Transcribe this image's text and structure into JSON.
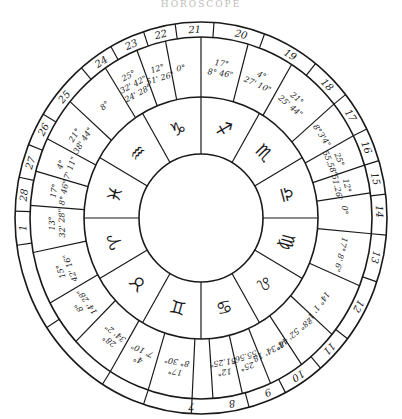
{
  "title": "HOROSCOPE",
  "colors": {
    "ink": "#1a1a1a",
    "paper": "#ffffff"
  },
  "geometry": {
    "cx": 201,
    "cy": 218,
    "outer_rx": 186,
    "outer_ry": 196,
    "house_ring_rx": 171,
    "house_ring_ry": 181,
    "degree_ring_rx": 117,
    "degree_ring_ry": 121,
    "inner_rx": 62,
    "inner_ry": 64
  },
  "zodiac_signs": [
    {
      "name": "capricorn",
      "glyph": "♑",
      "angle": -105
    },
    {
      "name": "sagittarius",
      "glyph": "♐",
      "angle": -75
    },
    {
      "name": "scorpio",
      "glyph": "♏",
      "angle": -45
    },
    {
      "name": "libra",
      "glyph": "♎",
      "angle": -15
    },
    {
      "name": "virgo",
      "glyph": "♍",
      "angle": 15
    },
    {
      "name": "leo",
      "glyph": "♌",
      "angle": 45
    },
    {
      "name": "cancer",
      "glyph": "♋",
      "angle": 75
    },
    {
      "name": "gemini",
      "glyph": "♊",
      "angle": 105
    },
    {
      "name": "taurus",
      "glyph": "♉",
      "angle": 135
    },
    {
      "name": "aries",
      "glyph": "♈",
      "angle": 165
    },
    {
      "name": "pisces",
      "glyph": "♓",
      "angle": 195
    },
    {
      "name": "aquarius",
      "glyph": "♒",
      "angle": 225
    }
  ],
  "house_numbers": [
    {
      "label": "7",
      "angle": 93
    },
    {
      "label": "8",
      "angle": 80
    },
    {
      "label": "9",
      "angle": 68
    },
    {
      "label": "10",
      "angle": 57
    },
    {
      "label": "11",
      "angle": 44
    },
    {
      "label": "12",
      "angle": 28
    },
    {
      "label": "13",
      "angle": 12
    },
    {
      "label": "14",
      "angle": -2
    },
    {
      "label": "15",
      "angle": -12
    },
    {
      "label": "16",
      "angle": -22
    },
    {
      "label": "17",
      "angle": -33
    },
    {
      "label": "18",
      "angle": -45
    },
    {
      "label": "19",
      "angle": -60
    },
    {
      "label": "20",
      "angle": -77
    },
    {
      "label": "21",
      "angle": -92
    },
    {
      "label": "22",
      "angle": -103
    },
    {
      "label": "23",
      "angle": -113
    },
    {
      "label": "24",
      "angle": -124
    },
    {
      "label": "25",
      "angle": -140
    },
    {
      "label": "26",
      "angle": -152
    },
    {
      "label": "27",
      "angle": -163
    },
    {
      "label": "28",
      "angle": -173
    },
    {
      "label": "1",
      "angle": 177
    }
  ],
  "degree_entries": [
    {
      "lines": [
        "17°",
        "8° 30\""
      ],
      "angle": 100
    },
    {
      "lines": [
        "12°",
        "51.25\""
      ],
      "angle": 81
    },
    {
      "lines": [
        "25°",
        "55.56\""
      ],
      "angle": 72
    },
    {
      "lines": [
        "8°34' 18"
      ],
      "angle": 62
    },
    {
      "lines": [
        "28° 52' 44\""
      ],
      "angle": 50
    },
    {
      "lines": [
        "14° 1' 1\""
      ],
      "angle": 36
    },
    {
      "lines": [
        "17° 8' 6\""
      ],
      "angle": 14
    },
    {
      "lines": [
        "0°"
      ],
      "angle": -3
    },
    {
      "lines": [
        "12°",
        "51.26\""
      ],
      "angle": -12
    },
    {
      "lines": [
        "25°",
        "55.58\""
      ],
      "angle": -22
    },
    {
      "lines": [
        "8°3'4\""
      ],
      "angle": -33
    },
    {
      "lines": [
        "21°",
        "25' 44\""
      ],
      "angle": -50
    },
    {
      "lines": [
        "4°",
        "27' 10\""
      ],
      "angle": -66
    },
    {
      "lines": [
        "17°",
        "8° 46\""
      ],
      "angle": -82
    },
    {
      "lines": [
        "0°"
      ],
      "angle": -98
    },
    {
      "lines": [
        "12°",
        "51' 26\""
      ],
      "angle": -107
    },
    {
      "lines": [
        "25°",
        "32' 42\"",
        "24' 28\""
      ],
      "angle": -118
    },
    {
      "lines": [
        "8°"
      ],
      "angle": -132
    },
    {
      "lines": [
        "21°",
        "38' 44\""
      ],
      "angle": -148
    },
    {
      "lines": [
        "4°",
        "7' 11\""
      ],
      "angle": -160
    },
    {
      "lines": [
        "17°",
        "8° 46\""
      ],
      "angle": -170
    },
    {
      "lines": [
        "13°",
        "32' 28\""
      ],
      "angle": 178
    },
    {
      "lines": [
        "15°",
        "42' 16\""
      ],
      "angle": 160
    },
    {
      "lines": [
        "8°",
        "14' 28\""
      ],
      "angle": 145
    },
    {
      "lines": [
        "28°",
        "34' 2\""
      ],
      "angle": 128
    },
    {
      "lines": [
        "4°",
        "7' 10\""
      ],
      "angle": 115
    }
  ],
  "degree_dividers": [
    93,
    86,
    76,
    66,
    54,
    40,
    22,
    5,
    -8,
    -17,
    -27,
    -39,
    -58,
    -74,
    -90,
    -102,
    -112,
    -124,
    -140,
    -154,
    -165,
    -176,
    169,
    152,
    137,
    122,
    108
  ],
  "house_dividers": [
    93,
    75,
    63,
    50,
    38,
    19,
    5,
    -7,
    -17,
    -27,
    -39,
    -52,
    -70,
    -86,
    -98,
    -108,
    -119,
    -130,
    -148,
    -158,
    -168,
    -178,
    172,
    146,
    122,
    108
  ],
  "sign_dividers": [
    -90,
    -60,
    -30,
    0,
    30,
    60,
    90,
    120,
    150,
    180,
    210,
    240
  ]
}
